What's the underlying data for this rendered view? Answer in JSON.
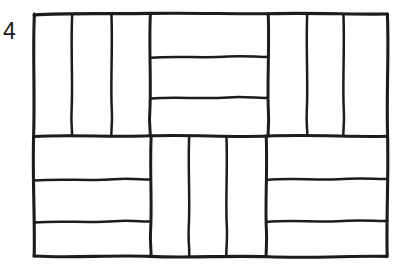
{
  "figure": {
    "label": "4",
    "kind": "hand-drawn line diagram",
    "ink_color": "#1c1c1c",
    "background_color": "#ffffff",
    "frame": {
      "x": 33,
      "y": 13,
      "width": 355,
      "height": 244
    },
    "grid": {
      "columns": 3,
      "rows": 2,
      "blocks_total": 6,
      "tiles_per_block": 3,
      "tiles_total": 18
    },
    "blocks": [
      {
        "name": "top-left",
        "orientation": "vertical",
        "tile_count": 3,
        "bounds": {
          "x0": 33,
          "y0": 13,
          "x1": 150,
          "y1": 136
        },
        "dividers": [
          72,
          111
        ]
      },
      {
        "name": "top-middle",
        "orientation": "horizontal",
        "tile_count": 3,
        "bounds": {
          "x0": 150,
          "y0": 13,
          "x1": 268,
          "y1": 136
        },
        "dividers": [
          57,
          98
        ]
      },
      {
        "name": "top-right",
        "orientation": "vertical",
        "tile_count": 3,
        "bounds": {
          "x0": 268,
          "y0": 13,
          "x1": 388,
          "y1": 136
        },
        "dividers": [
          307,
          343
        ]
      },
      {
        "name": "bottom-left",
        "orientation": "horizontal",
        "tile_count": 3,
        "bounds": {
          "x0": 33,
          "y0": 136,
          "x1": 151,
          "y1": 257
        },
        "dividers": [
          180,
          222
        ]
      },
      {
        "name": "bottom-middle",
        "orientation": "vertical",
        "tile_count": 3,
        "bounds": {
          "x0": 151,
          "y0": 136,
          "x1": 266,
          "y1": 257
        },
        "dividers": [
          189,
          226
        ]
      },
      {
        "name": "bottom-right",
        "orientation": "horizontal",
        "tile_count": 3,
        "bounds": {
          "x0": 266,
          "y0": 136,
          "x1": 388,
          "y1": 257
        },
        "dividers": [
          180,
          222
        ]
      }
    ]
  }
}
